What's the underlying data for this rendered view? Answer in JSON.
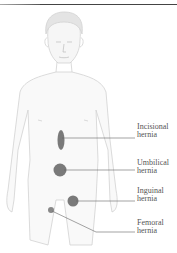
{
  "diagram": {
    "labels": [
      {
        "id": "incisional",
        "line1": "Incisional",
        "line2": "hernia"
      },
      {
        "id": "umbilical",
        "line1": "Umbilical",
        "line2": "hernia"
      },
      {
        "id": "inguinal",
        "line1": "Inguinal",
        "line2": "hernia"
      },
      {
        "id": "femoral",
        "line1": "Femoral",
        "line2": "hernia"
      }
    ],
    "colors": {
      "marker": "#777777",
      "body_outline": "#cfcfcf",
      "leader_line": "#666666",
      "label_text": "#555555"
    }
  }
}
